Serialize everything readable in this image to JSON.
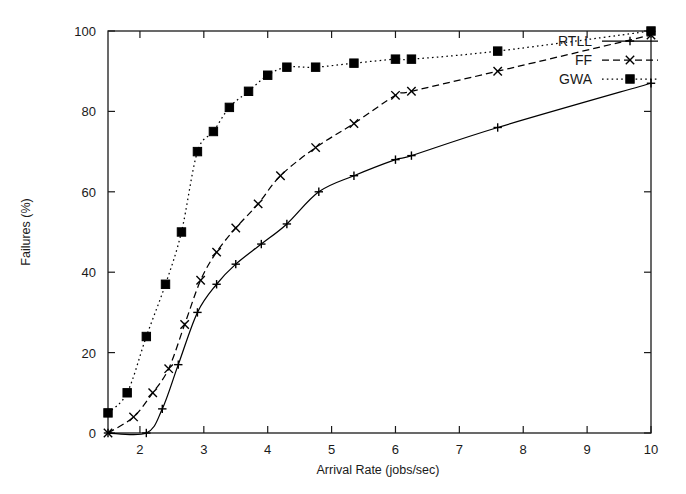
{
  "chart_data": {
    "type": "line",
    "title": "",
    "subtitle": "",
    "xlabel": "Arrival Rate (jobs/sec)",
    "ylabel": "Failures (%)",
    "xlim": [
      1.5,
      10
    ],
    "ylim": [
      0,
      100
    ],
    "grid": false,
    "legend_position": "top-right",
    "x_ticks": [
      2,
      3,
      4,
      5,
      6,
      7,
      8,
      9,
      10
    ],
    "x_tick_labels": [
      "2",
      "3",
      "4",
      "5",
      "6",
      "7",
      "8",
      "9",
      "10"
    ],
    "y_ticks": [
      0,
      20,
      40,
      60,
      80,
      100
    ],
    "y_tick_labels": [
      "0",
      "20",
      "40",
      "60",
      "80",
      "100"
    ],
    "series": [
      {
        "name": "RTLL",
        "linestyle": "solid",
        "marker": "plus",
        "color": "#000000",
        "x": [
          1.5,
          2.1,
          2.35,
          2.6,
          2.9,
          3.2,
          3.5,
          3.9,
          4.3,
          4.8,
          5.35,
          6.0,
          6.25,
          7.6,
          10.0
        ],
        "y": [
          0,
          0,
          6,
          17,
          30,
          37,
          42,
          47,
          52,
          60,
          64,
          68,
          69,
          76,
          87
        ]
      },
      {
        "name": "FF",
        "linestyle": "dashed",
        "marker": "cross",
        "color": "#000000",
        "x": [
          1.5,
          1.9,
          2.2,
          2.45,
          2.7,
          2.95,
          3.2,
          3.5,
          3.85,
          4.2,
          4.75,
          5.35,
          6.0,
          6.25,
          7.6,
          10.0
        ],
        "y": [
          0,
          4,
          10,
          16,
          27,
          38,
          45,
          51,
          57,
          64,
          71,
          77,
          84,
          85,
          90,
          99
        ]
      },
      {
        "name": "GWA",
        "linestyle": "dotted",
        "marker": "square",
        "color": "#000000",
        "x": [
          1.5,
          1.8,
          2.1,
          2.4,
          2.65,
          2.9,
          3.15,
          3.4,
          3.7,
          4.0,
          4.3,
          4.75,
          5.35,
          6.0,
          6.25,
          7.6,
          10.0
        ],
        "y": [
          5,
          10,
          24,
          37,
          50,
          70,
          75,
          81,
          85,
          89,
          91,
          91,
          92,
          93,
          93,
          95,
          100
        ]
      }
    ]
  },
  "legend": {
    "entries": [
      {
        "label": "RTLL"
      },
      {
        "label": "FF"
      },
      {
        "label": "GWA"
      }
    ]
  }
}
